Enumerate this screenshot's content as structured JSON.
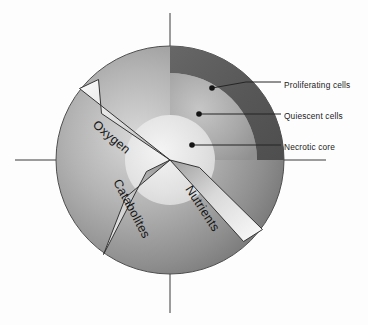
{
  "figure": {
    "kind": "tumor-spheroid-cross-section",
    "background_color": "#fdfdfd"
  },
  "axes": {
    "name": "crosshair-axes",
    "color": "#3b3b3b",
    "line_width": 1,
    "horizontal": {
      "x1": 15,
      "x2": 326,
      "y": 160
    },
    "vertical": {
      "y1": 13,
      "y2": 313,
      "x": 170
    }
  },
  "spheroid": {
    "center": {
      "x": 170,
      "y": 160
    },
    "outline_color": "#4a4a4a",
    "zones": [
      {
        "id": "proliferating",
        "label": "Proliferating cells",
        "radius_outer": 114,
        "radius_inner": 87,
        "fill_dark": "#5d5d5d",
        "fill_light": "#7c7c7c",
        "note": "dark outer rim, drawn 0 to 90 degrees in upper-right quadrant"
      },
      {
        "id": "quiescent",
        "label": "Quiescent cells",
        "radius_outer": 87,
        "radius_inner": 45,
        "fill_dark": "#9a9a9a",
        "fill_light": "#b8b8b8"
      },
      {
        "id": "necrotic",
        "label": "Necrotic core",
        "radius_outer": 45,
        "radius_inner": 0,
        "fill_dark": "#d2d2d2",
        "fill_light": "#f2f2f2"
      }
    ],
    "body_fill_dark": "#6f6f6f",
    "body_fill_light": "#c9c9c9"
  },
  "callouts": [
    {
      "id": "proliferating",
      "label": "Proliferating cells",
      "dot": {
        "x": 212,
        "y": 88
      },
      "elbow": {
        "x": 246,
        "y": 82
      },
      "end": {
        "x": 281,
        "y": 82
      }
    },
    {
      "id": "quiescent",
      "label": "Quiescent cells",
      "dot": {
        "x": 199,
        "y": 114
      },
      "elbow": {
        "x": 246,
        "y": 114
      },
      "end": {
        "x": 281,
        "y": 114
      }
    },
    {
      "id": "necrotic",
      "label": "Necrotic core",
      "dot": {
        "x": 192,
        "y": 145
      },
      "elbow": {
        "x": 246,
        "y": 145
      },
      "end": {
        "x": 281,
        "y": 145
      }
    }
  ],
  "transport_arrows": [
    {
      "id": "oxygen",
      "label": "Oxygen",
      "direction": "inward",
      "text_rotation_deg": 42,
      "text_anchor": {
        "x": 95,
        "y": 128
      },
      "fill_tip": "#9b9b9b",
      "fill_base": "#fafafa",
      "outline": "#3a3a3a",
      "polygon": [
        [
          170,
          160
        ],
        [
          80,
          89
        ],
        [
          98,
          80
        ],
        [
          101,
          113
        ]
      ]
    },
    {
      "id": "catabolites",
      "label": "Catabolites",
      "direction": "outward",
      "text_rotation_deg": -62,
      "text_anchor": {
        "x": 105,
        "y": 196
      },
      "fill_tip": "#8d8d8d",
      "fill_base": "#f5f5f5",
      "outline": "#3a3a3a",
      "polygon": [
        [
          170,
          160
        ],
        [
          147,
          172
        ],
        [
          104,
          254
        ],
        [
          124,
          198
        ]
      ]
    },
    {
      "id": "nutrients",
      "label": "Nutrients",
      "direction": "inward",
      "text_rotation_deg": 57,
      "text_anchor": {
        "x": 196,
        "y": 199
      },
      "fill_tip": "#9b9b9b",
      "fill_base": "#fafafa",
      "outline": "#3a3a3a",
      "polygon": [
        [
          170,
          160
        ],
        [
          243,
          241
        ],
        [
          262,
          230
        ],
        [
          199,
          168
        ]
      ]
    }
  ]
}
